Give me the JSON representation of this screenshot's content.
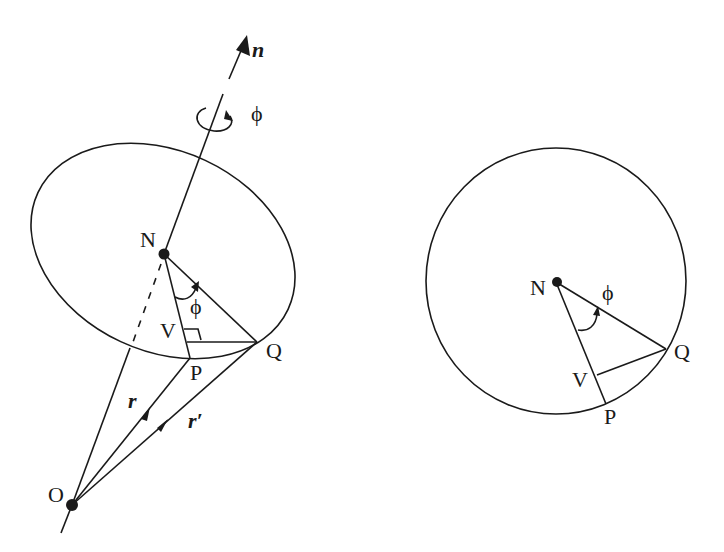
{
  "figure": {
    "colors": {
      "ink": "#1a1a1a",
      "background": "#ffffff"
    },
    "left": {
      "labels": {
        "axis": "n",
        "rotation": "ϕ",
        "center": "N",
        "angle": "ϕ",
        "foot": "V",
        "point_p": "P",
        "point_q": "Q",
        "origin": "O",
        "vec_r": "r",
        "vec_r_prime": "r′"
      }
    },
    "right": {
      "labels": {
        "center": "N",
        "angle": "ϕ",
        "point_q": "Q",
        "foot": "V",
        "point_p": "P"
      }
    }
  }
}
